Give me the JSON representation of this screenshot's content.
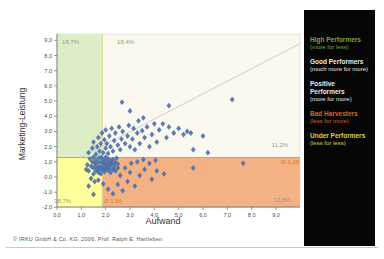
{
  "chart_data": {
    "type": "scatter",
    "title": "",
    "xlabel": "Aufwand",
    "ylabel": "Marketing-Leistung",
    "xlim": [
      0,
      9
    ],
    "ylim": [
      -2,
      9
    ],
    "xticks": [
      "0,0",
      "1,0",
      "2,0",
      "3,0",
      "4,0",
      "5,0",
      "6,0",
      "7,0",
      "8,0",
      "9,0"
    ],
    "yticks": [
      "9,0",
      "8,0",
      "7,0",
      "6,0",
      "5,0",
      "4,0",
      "3,0",
      "2,0",
      "1,0",
      "0,0",
      "-1,0",
      "-2,0"
    ],
    "avg_x": 1.86,
    "avg_y": 1.28,
    "avg_x_label": "Ø 1,86",
    "avg_y_label": "Ø 1,28",
    "diagonal": {
      "x1": 0.95,
      "y1": 1.28,
      "x2": 10.0,
      "y2": 8.8
    },
    "colors": {
      "plot_background": "#faf8ef",
      "region_green": "#ddeec6",
      "region_yellow": "#ffff9c",
      "region_orange": "#f4b183",
      "boundary_vertical": "#d6d68e",
      "boundary_horizontal": "#e2926a",
      "diagonal_line": "#cfcfc2",
      "point": "#4a6fad",
      "axis": "#808080",
      "tick_text": "#4a4a4a",
      "pct_label": "#9b9b8b",
      "avg_label": "#e07b28"
    },
    "annotations": [
      {
        "text": "18,7%",
        "x": 0.21,
        "y": 8.76,
        "anchor": "start",
        "role": "pct"
      },
      {
        "text": "18,4%",
        "x": 2.47,
        "y": 8.76,
        "anchor": "start",
        "role": "pct"
      },
      {
        "text": "11,2%",
        "x": 9.5,
        "y": 1.95,
        "anchor": "end",
        "role": "pct"
      },
      {
        "text": "Ø 1,28",
        "x": 9.95,
        "y": 0.86,
        "anchor": "end",
        "role": "avg"
      },
      {
        "text": "12,8%",
        "x": 9.6,
        "y": -1.65,
        "anchor": "end",
        "role": "pct"
      },
      {
        "text": "38,7%",
        "x": -0.12,
        "y": -1.7,
        "anchor": "start",
        "role": "pct"
      },
      {
        "text": "Ø 1,86",
        "x": 1.93,
        "y": -1.72,
        "anchor": "start",
        "role": "avg"
      }
    ],
    "points": [
      [
        1.2,
        0.5
      ],
      [
        1.25,
        0.8
      ],
      [
        1.3,
        0.4
      ],
      [
        1.35,
        1.2
      ],
      [
        1.4,
        0.7
      ],
      [
        1.45,
        1.0
      ],
      [
        1.5,
        0.2
      ],
      [
        1.5,
        0.6
      ],
      [
        1.5,
        1.3
      ],
      [
        1.55,
        0.9
      ],
      [
        1.6,
        0.4
      ],
      [
        1.6,
        0.75
      ],
      [
        1.6,
        1.1
      ],
      [
        1.65,
        0.55
      ],
      [
        1.7,
        0.3
      ],
      [
        1.7,
        0.65
      ],
      [
        1.7,
        0.95
      ],
      [
        1.72,
        1.25
      ],
      [
        1.75,
        0.5
      ],
      [
        1.8,
        0.2
      ],
      [
        1.8,
        0.7
      ],
      [
        1.8,
        1.0
      ],
      [
        1.82,
        1.3
      ],
      [
        1.85,
        0.45
      ],
      [
        1.9,
        0.6
      ],
      [
        1.9,
        0.9
      ],
      [
        1.9,
        1.15
      ],
      [
        1.95,
        0.35
      ],
      [
        2.0,
        0.55
      ],
      [
        2.0,
        0.8
      ],
      [
        2.0,
        1.05
      ],
      [
        2.0,
        1.3
      ],
      [
        2.05,
        0.7
      ],
      [
        2.1,
        0.45
      ],
      [
        2.1,
        0.9
      ],
      [
        2.1,
        1.2
      ],
      [
        2.15,
        0.6
      ],
      [
        2.2,
        0.3
      ],
      [
        2.2,
        0.75
      ],
      [
        2.2,
        1.05
      ],
      [
        2.25,
        0.9
      ],
      [
        2.3,
        0.5
      ],
      [
        2.3,
        1.15
      ],
      [
        2.35,
        0.7
      ],
      [
        2.4,
        0.95
      ],
      [
        2.4,
        0.4
      ],
      [
        2.45,
        1.25
      ],
      [
        2.5,
        0.6
      ],
      [
        2.5,
        0.85
      ],
      [
        1.4,
        -0.1
      ],
      [
        1.55,
        -0.3
      ],
      [
        1.3,
        -0.6
      ],
      [
        1.5,
        -1.15
      ],
      [
        1.7,
        -0.2
      ],
      [
        1.9,
        -0.45
      ],
      [
        1.3,
        1.6
      ],
      [
        1.45,
        1.9
      ],
      [
        1.5,
        2.3
      ],
      [
        1.6,
        1.5
      ],
      [
        1.65,
        2.0
      ],
      [
        1.7,
        2.6
      ],
      [
        1.75,
        1.7
      ],
      [
        1.8,
        2.2
      ],
      [
        1.85,
        2.9
      ],
      [
        1.9,
        1.6
      ],
      [
        1.95,
        2.45
      ],
      [
        2.0,
        1.9
      ],
      [
        2.0,
        3.1
      ],
      [
        2.05,
        2.2
      ],
      [
        2.1,
        1.55
      ],
      [
        2.15,
        2.7
      ],
      [
        2.2,
        2.0
      ],
      [
        2.25,
        3.2
      ],
      [
        2.3,
        1.7
      ],
      [
        2.35,
        2.4
      ],
      [
        2.4,
        2.9
      ],
      [
        2.5,
        2.1
      ],
      [
        2.55,
        3.3
      ],
      [
        2.6,
        1.8
      ],
      [
        2.65,
        2.5
      ],
      [
        2.7,
        3.0
      ],
      [
        2.8,
        2.2
      ],
      [
        2.9,
        2.7
      ],
      [
        2.95,
        3.4
      ],
      [
        3.0,
        2.0
      ],
      [
        3.1,
        2.5
      ],
      [
        3.15,
        3.2
      ],
      [
        3.2,
        1.8
      ],
      [
        3.3,
        2.9
      ],
      [
        3.35,
        3.7
      ],
      [
        3.4,
        2.2
      ],
      [
        3.5,
        3.05
      ],
      [
        3.55,
        3.9
      ],
      [
        3.6,
        2.6
      ],
      [
        3.7,
        3.3
      ],
      [
        3.8,
        2.0
      ],
      [
        3.9,
        2.8
      ],
      [
        4.0,
        3.5
      ],
      [
        4.1,
        2.3
      ],
      [
        4.2,
        3.1
      ],
      [
        4.35,
        3.5
      ],
      [
        4.5,
        2.6
      ],
      [
        4.6,
        3.3
      ],
      [
        4.8,
        2.9
      ],
      [
        5.0,
        3.2
      ],
      [
        5.2,
        2.8
      ],
      [
        5.35,
        3.0
      ],
      [
        5.5,
        2.9
      ],
      [
        2.1,
        -0.8
      ],
      [
        2.3,
        -1.1
      ],
      [
        2.5,
        -0.5
      ],
      [
        2.7,
        -0.9
      ],
      [
        2.9,
        -0.3
      ],
      [
        3.0,
        0.3
      ],
      [
        3.2,
        -0.6
      ],
      [
        3.4,
        0.1
      ],
      [
        3.6,
        0.5
      ],
      [
        3.9,
        -0.15
      ],
      [
        4.1,
        0.4
      ],
      [
        4.4,
        0.2
      ],
      [
        2.6,
        0.1
      ],
      [
        2.8,
        0.6
      ],
      [
        3.05,
        0.9
      ],
      [
        3.3,
        1.0
      ],
      [
        3.55,
        1.15
      ],
      [
        3.8,
        0.9
      ],
      [
        4.05,
        1.1
      ],
      [
        2.67,
        4.93
      ],
      [
        3.0,
        4.35
      ],
      [
        4.6,
        4.7
      ],
      [
        7.2,
        5.1
      ],
      [
        6.0,
        2.7
      ],
      [
        5.6,
        1.8
      ],
      [
        5.6,
        0.6
      ],
      [
        7.65,
        0.9
      ],
      [
        6.2,
        1.6
      ]
    ]
  },
  "legend": {
    "items": [
      {
        "title": "High Performers",
        "subtitle": "(more for less)",
        "color": "#76a73e"
      },
      {
        "title": "Good Performers",
        "subtitle": "(much more for more)",
        "color": "#eaeae2"
      },
      {
        "title": "Positive Performers",
        "subtitle": "(more for more)",
        "color": "#eaeae2"
      },
      {
        "title": "Bad Harvesters",
        "subtitle": "(less for more)",
        "color": "#cf6a28"
      },
      {
        "title": "Under Performers",
        "subtitle": "(less for less)",
        "color": "#d6d63e"
      }
    ]
  },
  "footer": {
    "copyright": "© IRKU GmbH & Co. KG, 2006. Prof. Ralph E. Hartleben"
  }
}
